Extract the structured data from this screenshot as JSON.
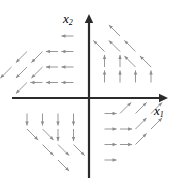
{
  "figure": {
    "title": "",
    "width": 183,
    "height": 189,
    "background_color": "#ffffff"
  },
  "axes": {
    "x_axis": {
      "label": "x",
      "subscript": "1",
      "color": "#2b2b2b",
      "y_position": 98,
      "x_start": 12,
      "x_end": 168,
      "arrow_at": "right"
    },
    "y_axis": {
      "label": "x",
      "subscript": "2",
      "color": "#2b2b2b",
      "x_position": 89,
      "y_start": 178,
      "y_end": 14,
      "arrow_at": "top"
    }
  },
  "chart_data": {
    "type": "scatter",
    "plot_kind": "vector-field",
    "title": "",
    "xlabel": "x1",
    "ylabel": "x2",
    "xlim": [
      -4,
      4
    ],
    "ylim": [
      -4,
      4
    ],
    "grid": false,
    "legend": null,
    "origin_px": [
      89,
      98
    ],
    "grid_spacing_px": 15.5,
    "arrow_color": "#8c8c8c",
    "regions": [
      {
        "name": "quadrant-2-inner",
        "quadrant": 2,
        "direction": "left",
        "angle_deg": 180
      },
      {
        "name": "quadrant-2-outer",
        "quadrant": 2,
        "direction": "down-left",
        "angle_deg": 225
      },
      {
        "name": "quadrant-1-inner",
        "quadrant": 1,
        "direction": "up",
        "angle_deg": 90
      },
      {
        "name": "quadrant-1-outer",
        "quadrant": 1,
        "direction": "up-left",
        "angle_deg": 135
      },
      {
        "name": "quadrant-3-inner",
        "quadrant": 3,
        "direction": "down",
        "angle_deg": 270
      },
      {
        "name": "quadrant-3-outer",
        "quadrant": 3,
        "direction": "down-right",
        "angle_deg": 315
      },
      {
        "name": "quadrant-4-inner",
        "quadrant": 4,
        "direction": "right",
        "angle_deg": 0
      },
      {
        "name": "quadrant-4-outer",
        "quadrant": 4,
        "direction": "up-right",
        "angle_deg": 45
      }
    ],
    "vectors": [
      {
        "x": -1,
        "y": 4,
        "angle_deg": 180,
        "len": 1.0
      },
      {
        "x": -1,
        "y": 3,
        "angle_deg": 180,
        "len": 1.0
      },
      {
        "x": -2,
        "y": 3,
        "angle_deg": 180,
        "len": 1.0
      },
      {
        "x": -1,
        "y": 2,
        "angle_deg": 180,
        "len": 1.0
      },
      {
        "x": -2,
        "y": 2,
        "angle_deg": 180,
        "len": 1.0
      },
      {
        "x": -1,
        "y": 1,
        "angle_deg": 180,
        "len": 1.0
      },
      {
        "x": -2,
        "y": 1,
        "angle_deg": 180,
        "len": 1.0
      },
      {
        "x": -3,
        "y": 1,
        "angle_deg": 180,
        "len": 1.0
      },
      {
        "x": -3,
        "y": 3,
        "angle_deg": 225,
        "len": 1.3
      },
      {
        "x": -4,
        "y": 3,
        "angle_deg": 225,
        "len": 1.3
      },
      {
        "x": -4,
        "y": 2,
        "angle_deg": 225,
        "len": 1.3
      },
      {
        "x": -5,
        "y": 2,
        "angle_deg": 225,
        "len": 1.3
      },
      {
        "x": -3,
        "y": 2,
        "angle_deg": 225,
        "len": 1.3
      },
      {
        "x": -4,
        "y": 1,
        "angle_deg": 225,
        "len": 1.3
      },
      {
        "x": 1,
        "y": 1,
        "angle_deg": 90,
        "len": 1.0
      },
      {
        "x": 2,
        "y": 1,
        "angle_deg": 90,
        "len": 1.0
      },
      {
        "x": 3,
        "y": 1,
        "angle_deg": 90,
        "len": 1.0
      },
      {
        "x": 4,
        "y": 1,
        "angle_deg": 90,
        "len": 1.0
      },
      {
        "x": 1,
        "y": 2,
        "angle_deg": 90,
        "len": 1.0
      },
      {
        "x": 2,
        "y": 2,
        "angle_deg": 90,
        "len": 1.0
      },
      {
        "x": 2,
        "y": 3,
        "angle_deg": 135,
        "len": 1.3
      },
      {
        "x": 3,
        "y": 3,
        "angle_deg": 135,
        "len": 1.3
      },
      {
        "x": 3,
        "y": 2,
        "angle_deg": 135,
        "len": 1.3
      },
      {
        "x": 4,
        "y": 2,
        "angle_deg": 135,
        "len": 1.3
      },
      {
        "x": 1,
        "y": 3,
        "angle_deg": 135,
        "len": 1.3
      },
      {
        "x": 2,
        "y": 4,
        "angle_deg": 135,
        "len": 1.3
      },
      {
        "x": -1,
        "y": -1,
        "angle_deg": 270,
        "len": 1.0
      },
      {
        "x": -2,
        "y": -1,
        "angle_deg": 270,
        "len": 1.0
      },
      {
        "x": -3,
        "y": -1,
        "angle_deg": 270,
        "len": 1.0
      },
      {
        "x": -4,
        "y": -1,
        "angle_deg": 270,
        "len": 1.0
      },
      {
        "x": -1,
        "y": -2,
        "angle_deg": 270,
        "len": 1.0
      },
      {
        "x": -2,
        "y": -2,
        "angle_deg": 270,
        "len": 1.0
      },
      {
        "x": -2,
        "y": -3,
        "angle_deg": 315,
        "len": 1.3
      },
      {
        "x": -3,
        "y": -3,
        "angle_deg": 315,
        "len": 1.3
      },
      {
        "x": -3,
        "y": -2,
        "angle_deg": 315,
        "len": 1.3
      },
      {
        "x": -4,
        "y": -2,
        "angle_deg": 315,
        "len": 1.3
      },
      {
        "x": -1,
        "y": -3,
        "angle_deg": 315,
        "len": 1.3
      },
      {
        "x": -2,
        "y": -4,
        "angle_deg": 315,
        "len": 1.3
      },
      {
        "x": 1,
        "y": -1,
        "angle_deg": 0,
        "len": 1.0
      },
      {
        "x": 1,
        "y": -2,
        "angle_deg": 0,
        "len": 1.0
      },
      {
        "x": 2,
        "y": -2,
        "angle_deg": 0,
        "len": 1.0
      },
      {
        "x": 1,
        "y": -3,
        "angle_deg": 0,
        "len": 1.0
      },
      {
        "x": 2,
        "y": -3,
        "angle_deg": 0,
        "len": 1.0
      },
      {
        "x": 1,
        "y": -4,
        "angle_deg": 0,
        "len": 1.0
      },
      {
        "x": 2,
        "y": -1,
        "angle_deg": 45,
        "len": 1.3
      },
      {
        "x": 3,
        "y": -1,
        "angle_deg": 45,
        "len": 1.3
      },
      {
        "x": 3,
        "y": -2,
        "angle_deg": 45,
        "len": 1.3
      },
      {
        "x": 4,
        "y": -2,
        "angle_deg": 45,
        "len": 1.3
      },
      {
        "x": 3,
        "y": -3,
        "angle_deg": 45,
        "len": 1.3
      },
      {
        "x": 4,
        "y": -1,
        "angle_deg": 45,
        "len": 1.3
      }
    ]
  }
}
